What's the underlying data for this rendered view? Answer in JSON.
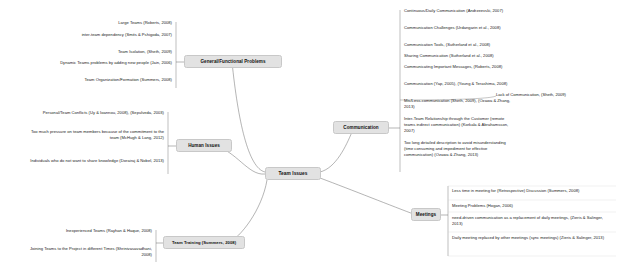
{
  "diagram": {
    "type": "mind-map",
    "title": "Team Issues",
    "center": {
      "label": "Team Issues"
    },
    "branches": [
      {
        "id": "general-functional-problems",
        "label": "General/Functional Problems",
        "side": "left",
        "items": [
          "Large Teams (Roberts, 2008)",
          "inter-team dependency (Smits & Pshigoda, 2007)",
          "Team Isolation, (Sheth, 2009)",
          "Dynamic Teams problems by adding new people (Jain, 2006)",
          "Team Organization/Formation (Summers, 2008)"
        ]
      },
      {
        "id": "human-issues",
        "label": "Human Issues",
        "side": "left",
        "items": [
          "Personal/Team Conflicts (Uy & Ioannou, 2008), (Sepulveda, 2003)",
          "Too much pressure on team members because of the commitment to the team (McHugh & Lang, 2012)",
          "Individuals who do not want to share knowledge (Dorairaj & Nobel, 2013)"
        ]
      },
      {
        "id": "team-training",
        "label": "Team Training (Summers, 2008)",
        "side": "left",
        "items": [
          "Inexperienced Teams (Rayhan & Haque, 2008)",
          "Joining Teams to the Project in different Times (Shrinivasavadhani, 2008)"
        ]
      },
      {
        "id": "communication",
        "label": "Communication",
        "side": "right",
        "items": [
          "Continuous/Daily Communication (Andrzeevski, 2007)",
          "Communication Challenges (Urdangarin et al., 2008)",
          "Communication Tools, (Sutherland et al., 2008)",
          "Sharing Communication (Sutherland et al., 2008)",
          "Communicating Important Messages, (Roberts, 2008)",
          "Communication (Yap, 2005), (Young & Terashima, 2008)",
          "Mis/Less-communication (Sheth, 2009), (Ozawa & Zhang, 2013)",
          "Inter-Team Relationship through the Customer (remote teams indirect communication) (Korkala & Abrahamsson, 2007)",
          "Too long detailed description to avoid misunderstanding (time consuming and impediment for effective communication) (Ozawa & Zhang, 2013)"
        ],
        "annotation": "Lack of Communication, (Sheth, 2009)"
      },
      {
        "id": "meetings",
        "label": "Meetings",
        "side": "right",
        "items": [
          "Less time in meeting for (Retrospective) Discussion (Summers, 2008)",
          "Meeting Problems (Hogan, 2006)",
          "need-driven communication as a replacement of daily meetings, (Zieris & Salinger, 2013)",
          "Daily meeting replaced by other meetings (sync meetings) (Zieris & Salinger, 2013)"
        ]
      }
    ],
    "colors": {
      "node_fill": "#e2e2e2",
      "node_border": "#c8c8c8",
      "link": "#5a5a5a",
      "text": "#1a1a1a",
      "background": "#ffffff"
    }
  }
}
